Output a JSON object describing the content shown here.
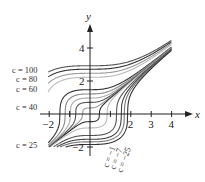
{
  "chart_data": {
    "type": "line",
    "title": "",
    "xlabel": "x",
    "ylabel": "y",
    "xlim": [
      -2.2,
      4.5
    ],
    "ylim": [
      -2.3,
      5.2
    ],
    "x_ticks": [
      -2,
      -1,
      1,
      2,
      3,
      4
    ],
    "x_tick_labels": [
      "−2",
      "",
      "",
      "2",
      "3",
      "4"
    ],
    "y_ticks": [
      4,
      2,
      -2
    ],
    "y_tick_labels": [
      "4",
      "2",
      "−2"
    ],
    "grid": false,
    "legend": "none",
    "family": "y = (x^3 + k)^(1/3)",
    "series": [
      {
        "name": "c = 100",
        "k": 25,
        "color": "#555555"
      },
      {
        "name": "c = 80",
        "k": 20,
        "color": "#333333"
      },
      {
        "name": "c = 60",
        "k": 15,
        "color": "#999999"
      },
      {
        "name": "",
        "k": 11,
        "color": "#bbbbbb"
      },
      {
        "name": "c = 40",
        "k": 3.2,
        "color": "#333333"
      },
      {
        "name": "",
        "k": 1.8,
        "color": "#888888"
      },
      {
        "name": "",
        "k": 0.9,
        "color": "#aaaaaa"
      },
      {
        "name": "",
        "k": 0.35,
        "color": "#555555"
      },
      {
        "name": "",
        "k": 0.05,
        "color": "#999999"
      },
      {
        "name": "c = 25",
        "k": -0.1,
        "color": "#333333"
      },
      {
        "name": "",
        "k": -0.6,
        "color": "#bbbbbb"
      },
      {
        "name": "",
        "k": -2.2,
        "color": "#555555"
      },
      {
        "name": "c = −1",
        "k": -3.6,
        "color": "#444444"
      },
      {
        "name": "c = −7",
        "k": -4.8,
        "color": "#777777"
      },
      {
        "name": "c = −25",
        "k": -6.3,
        "color": "#333333"
      }
    ],
    "annotations": [
      {
        "text": "c = 100",
        "x": 12,
        "y": 73
      },
      {
        "text": "c = 80",
        "x": 16,
        "y": 82
      },
      {
        "text": "c = 60",
        "x": 16,
        "y": 92
      },
      {
        "text": "c = 40",
        "x": 16,
        "y": 110
      },
      {
        "text": "c = 25",
        "x": 16,
        "y": 148
      }
    ],
    "rotated_annotations": [
      {
        "text": "c = −1",
        "x": 108,
        "y": 168
      },
      {
        "text": "c = −7",
        "x": 115,
        "y": 170
      },
      {
        "text": "c = −25",
        "x": 122,
        "y": 173
      }
    ]
  }
}
